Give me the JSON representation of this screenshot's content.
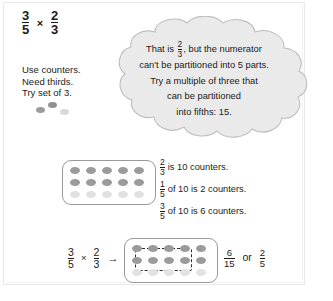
{
  "title_equation": {
    "left_fraction": {
      "numerator": "3",
      "denominator": "5"
    },
    "operator": "×",
    "right_fraction": {
      "numerator": "2",
      "denominator": "3"
    }
  },
  "instructions": {
    "line1": "Use counters.",
    "line2": "Need thirds.",
    "line3": "Try set of 3."
  },
  "loose_counters": {
    "count": 3,
    "colors": [
      "#9b9b9b",
      "#8f8f8f",
      "#d9d9d9"
    ]
  },
  "thought_bubble": {
    "line1_pre": "That is",
    "line1_fraction": {
      "numerator": "2",
      "denominator": "3"
    },
    "line1_post": ", but the numerator",
    "line2": "can't be partitioned into 5 parts.",
    "line3": "Try a multiple of three that",
    "line4": "can be partitioned",
    "line5": "into fifths: 15.",
    "fill_color": "#eaeaea",
    "stroke_color": "#bdbdbd"
  },
  "counter_board_middle": {
    "columns": 5,
    "rows": 3,
    "dark_rows": 2,
    "dark_color": "#9b9b9b",
    "light_color": "#e2e2e2",
    "total_counters": 15
  },
  "statements": [
    {
      "fraction": {
        "numerator": "2",
        "denominator": "3"
      },
      "text": "is 10 counters."
    },
    {
      "fraction": {
        "numerator": "1",
        "denominator": "5"
      },
      "text": "of 10 is 2 counters."
    },
    {
      "fraction": {
        "numerator": "3",
        "denominator": "5"
      },
      "text": "of 10 is 6 counters."
    }
  ],
  "bottom_equation": {
    "left_fraction": {
      "numerator": "3",
      "denominator": "5"
    },
    "operator": "×",
    "right_fraction": {
      "numerator": "2",
      "denominator": "3"
    },
    "arrow": "→"
  },
  "counter_board_bottom": {
    "columns": 5,
    "rows": 3,
    "dark_rows": 2,
    "dark_color": "#9b9b9b",
    "light_color": "#e2e2e2",
    "selection": {
      "columns": 3,
      "rows": 2,
      "selected_count": 6
    }
  },
  "result": {
    "fraction": {
      "numerator": "6",
      "denominator": "15"
    },
    "or_word": "or",
    "simplified": {
      "numerator": "2",
      "denominator": "5"
    }
  }
}
